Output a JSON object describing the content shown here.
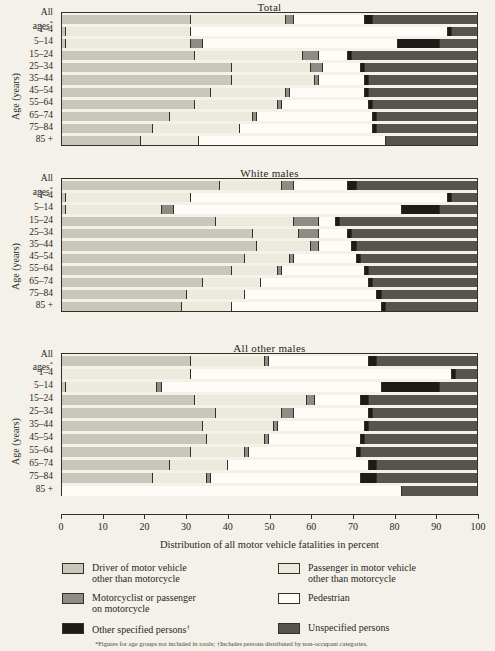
{
  "figure": {
    "x_axis_title": "Distribution of all motor vehicle fatalities in percent",
    "y_axis_title": "Age (years)",
    "footnote": "*Figures for age groups not included in totals; †Includes persons distributed by non-occupant categories."
  },
  "age_labels": [
    "All ages*",
    "1–4",
    "5–14",
    "15–24",
    "25–34",
    "35–44",
    "45–54",
    "55–64",
    "65–74",
    "75–84",
    "85 +"
  ],
  "ticks": [
    {
      "value": 0,
      "label": "0"
    },
    {
      "value": 10,
      "label": "10"
    },
    {
      "value": 20,
      "label": "20"
    },
    {
      "value": 30,
      "label": "30"
    },
    {
      "value": 40,
      "label": "40"
    },
    {
      "value": 50,
      "label": "50"
    },
    {
      "value": 60,
      "label": "60"
    },
    {
      "value": 70,
      "label": "70"
    },
    {
      "value": 80,
      "label": "80"
    },
    {
      "value": 90,
      "label": "90"
    },
    {
      "value": 100,
      "label": "100"
    }
  ],
  "legend": [
    {
      "key": "driver",
      "label": "Driver of motor vehicle\nother than motorcycle",
      "color": "#c9c6bb"
    },
    {
      "key": "passenger",
      "label": "Passenger in motor vehicle\nother than motorcycle",
      "color": "#eceadd"
    },
    {
      "key": "moto",
      "label": "Motorcyclist or passenger\non motorcycle",
      "color": "#8f8c85"
    },
    {
      "key": "pedestrian",
      "label": "Pedestrian",
      "color": "#fdfcf7"
    },
    {
      "key": "other",
      "label": "Other specified persons†",
      "color": "#1d1b18"
    },
    {
      "key": "unspecified",
      "label": "Unspecified persons",
      "color": "#57544e"
    }
  ],
  "chart_data": {
    "type": "bar",
    "xlabel": "Distribution of all motor vehicle fatalities in percent",
    "ylabel": "Age (years)",
    "xlim": [
      0,
      100
    ],
    "grid": false,
    "orientation": "horizontal",
    "stacked": true,
    "legend_position": "bottom",
    "series_order": [
      "driver",
      "passenger",
      "moto",
      "pedestrian",
      "other",
      "unspecified"
    ],
    "categories": [
      "All ages*",
      "1–4",
      "5–14",
      "15–24",
      "25–34",
      "35–44",
      "45–54",
      "55–64",
      "65–74",
      "75–84",
      "85 +"
    ],
    "panels": [
      {
        "title": "Total",
        "rows": [
          {
            "category": "All ages*",
            "driver": 31,
            "passenger": 23,
            "moto": 2,
            "pedestrian": 17,
            "other": 2,
            "unspecified": 25
          },
          {
            "category": "1–4",
            "driver": 1,
            "passenger": 30,
            "moto": 0,
            "pedestrian": 62,
            "other": 1,
            "unspecified": 6
          },
          {
            "category": "5–14",
            "driver": 1,
            "passenger": 30,
            "moto": 3,
            "pedestrian": 47,
            "other": 10,
            "unspecified": 9
          },
          {
            "category": "15–24",
            "driver": 32,
            "passenger": 26,
            "moto": 4,
            "pedestrian": 7,
            "other": 1,
            "unspecified": 30
          },
          {
            "category": "25–34",
            "driver": 41,
            "passenger": 19,
            "moto": 3,
            "pedestrian": 9,
            "other": 1,
            "unspecified": 27
          },
          {
            "category": "35–44",
            "driver": 41,
            "passenger": 20,
            "moto": 1,
            "pedestrian": 11,
            "other": 1,
            "unspecified": 26
          },
          {
            "category": "45–54",
            "driver": 36,
            "passenger": 18,
            "moto": 1,
            "pedestrian": 18,
            "other": 1,
            "unspecified": 26
          },
          {
            "category": "55–64",
            "driver": 32,
            "passenger": 20,
            "moto": 1,
            "pedestrian": 21,
            "other": 1,
            "unspecified": 25
          },
          {
            "category": "65–74",
            "driver": 26,
            "passenger": 20,
            "moto": 1,
            "pedestrian": 28,
            "other": 1,
            "unspecified": 24
          },
          {
            "category": "75–84",
            "driver": 22,
            "passenger": 21,
            "moto": 0,
            "pedestrian": 32,
            "other": 1,
            "unspecified": 24
          },
          {
            "category": "85 +",
            "driver": 19,
            "passenger": 14,
            "moto": 0,
            "pedestrian": 45,
            "other": 0,
            "unspecified": 22
          }
        ]
      },
      {
        "title": "White males",
        "rows": [
          {
            "category": "All ages*",
            "driver": 38,
            "passenger": 15,
            "moto": 3,
            "pedestrian": 13,
            "other": 2,
            "unspecified": 29
          },
          {
            "category": "1–4",
            "driver": 1,
            "passenger": 30,
            "moto": 0,
            "pedestrian": 62,
            "other": 1,
            "unspecified": 6
          },
          {
            "category": "5–14",
            "driver": 1,
            "passenger": 23,
            "moto": 3,
            "pedestrian": 55,
            "other": 9,
            "unspecified": 9
          },
          {
            "category": "15–24",
            "driver": 37,
            "passenger": 19,
            "moto": 6,
            "pedestrian": 4,
            "other": 1,
            "unspecified": 33
          },
          {
            "category": "25–34",
            "driver": 46,
            "passenger": 11,
            "moto": 5,
            "pedestrian": 7,
            "other": 1,
            "unspecified": 30
          },
          {
            "category": "35–44",
            "driver": 47,
            "passenger": 13,
            "moto": 2,
            "pedestrian": 8,
            "other": 1,
            "unspecified": 29
          },
          {
            "category": "45–54",
            "driver": 44,
            "passenger": 11,
            "moto": 1,
            "pedestrian": 15,
            "other": 1,
            "unspecified": 28
          },
          {
            "category": "55–64",
            "driver": 41,
            "passenger": 11,
            "moto": 1,
            "pedestrian": 20,
            "other": 1,
            "unspecified": 26
          },
          {
            "category": "65–74",
            "driver": 34,
            "passenger": 14,
            "moto": 0,
            "pedestrian": 26,
            "other": 1,
            "unspecified": 25
          },
          {
            "category": "75–84",
            "driver": 30,
            "passenger": 14,
            "moto": 0,
            "pedestrian": 32,
            "other": 1,
            "unspecified": 23
          },
          {
            "category": "85 +",
            "driver": 29,
            "passenger": 12,
            "moto": 0,
            "pedestrian": 36,
            "other": 1,
            "unspecified": 22
          }
        ]
      },
      {
        "title": "All other males",
        "rows": [
          {
            "category": "All ages*",
            "driver": 31,
            "passenger": 18,
            "moto": 1,
            "pedestrian": 24,
            "other": 2,
            "unspecified": 24
          },
          {
            "category": "1–4",
            "driver": 0,
            "passenger": 31,
            "moto": 0,
            "pedestrian": 63,
            "other": 1,
            "unspecified": 5
          },
          {
            "category": "5–14",
            "driver": 1,
            "passenger": 22,
            "moto": 1,
            "pedestrian": 53,
            "other": 14,
            "unspecified": 9
          },
          {
            "category": "15–24",
            "driver": 32,
            "passenger": 27,
            "moto": 2,
            "pedestrian": 11,
            "other": 2,
            "unspecified": 26
          },
          {
            "category": "25–34",
            "driver": 37,
            "passenger": 16,
            "moto": 3,
            "pedestrian": 18,
            "other": 1,
            "unspecified": 25
          },
          {
            "category": "35–44",
            "driver": 34,
            "passenger": 17,
            "moto": 1,
            "pedestrian": 21,
            "other": 1,
            "unspecified": 26
          },
          {
            "category": "45–54",
            "driver": 35,
            "passenger": 14,
            "moto": 1,
            "pedestrian": 22,
            "other": 1,
            "unspecified": 27
          },
          {
            "category": "55–64",
            "driver": 31,
            "passenger": 13,
            "moto": 1,
            "pedestrian": 26,
            "other": 1,
            "unspecified": 28
          },
          {
            "category": "65–74",
            "driver": 26,
            "passenger": 14,
            "moto": 0,
            "pedestrian": 34,
            "other": 2,
            "unspecified": 24
          },
          {
            "category": "75–84",
            "driver": 22,
            "passenger": 13,
            "moto": 1,
            "pedestrian": 36,
            "other": 4,
            "unspecified": 24
          },
          {
            "category": "85 +",
            "driver": 0,
            "passenger": 0,
            "moto": 0,
            "pedestrian": 82,
            "other": 0,
            "unspecified": 18
          }
        ]
      }
    ]
  }
}
